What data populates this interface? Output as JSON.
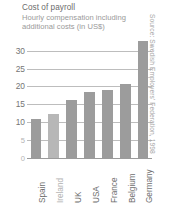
{
  "chart_data": {
    "type": "bar",
    "title": "Cost of payroll",
    "subtitle": "Hourly compensation including additional costs (in US$)",
    "xlabel": "",
    "ylabel": "",
    "ylim": [
      0,
      33
    ],
    "yticks": [
      0,
      5,
      10,
      15,
      20,
      25,
      30
    ],
    "grid": true,
    "legend": false,
    "source": "Source: Swedish Employers' Federation, 1998",
    "categories": [
      "Spain",
      "Ireland",
      "UK",
      "USA",
      "France",
      "Belgium",
      "Germany"
    ],
    "values": [
      11,
      12.2,
      16.3,
      18.4,
      19,
      20.6,
      32.7
    ],
    "bar_color": "#9c9c9c",
    "bar_color_alt": "#b7b7b7",
    "grid_color": "#bdbdbd",
    "text_color": "#6e6e6e"
  }
}
